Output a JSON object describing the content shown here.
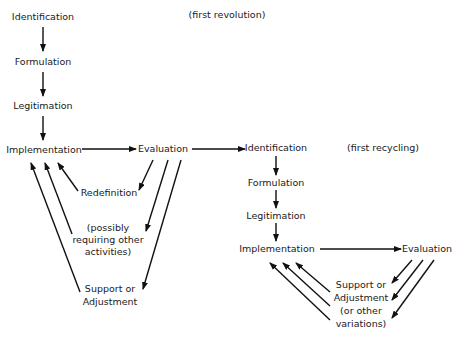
{
  "diagram": {
    "first_revolution": {
      "caption": "(first revolution)",
      "stages": {
        "identification": "Identification",
        "formulation": "Formulation",
        "legitimation": "Legitimation",
        "implementation": "Implementation",
        "evaluation": "Evaluation"
      },
      "feedback": {
        "redefinition": "Redefinition",
        "possibly_line1": "(possibly",
        "possibly_line2": "requiring other",
        "possibly_line3": "activities)",
        "support_line1": "Support or",
        "support_line2": "Adjustment"
      }
    },
    "first_recycling": {
      "caption": "(first recycling)",
      "stages": {
        "identification": "Identification",
        "formulation": "Formulation",
        "legitimation": "Legitimation",
        "implementation": "Implementation",
        "evaluation": "Evaluation"
      },
      "feedback": {
        "line1": "Support or",
        "line2": "Adjustment",
        "line3": "(or other",
        "line4": "variations)"
      }
    }
  }
}
